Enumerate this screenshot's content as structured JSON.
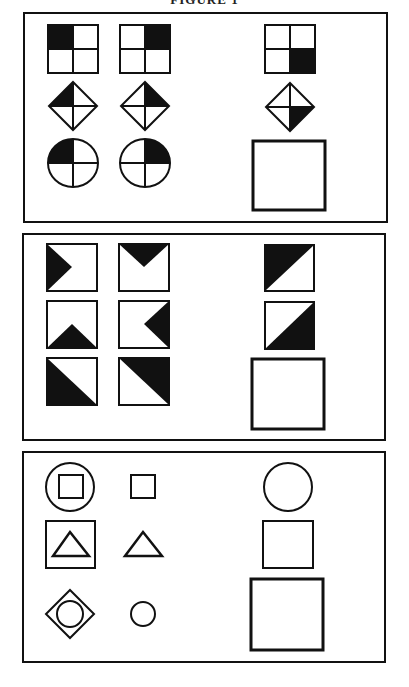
{
  "title": "FIGURE 1",
  "colors": {
    "ink": "#111111",
    "paper": "#ffffff"
  },
  "panels": [
    {
      "id": "panel-1",
      "description": "Quadrant shading rotates clockwise across each row",
      "rows": [
        {
          "shape": "square",
          "items": [
            "top-left",
            "top-right",
            "bottom-right"
          ]
        },
        {
          "shape": "diamond",
          "items": [
            "top-left",
            "top-right",
            "bottom-right"
          ]
        },
        {
          "shape": "circle",
          "items": [
            "top-left",
            "top-right",
            "answer-box"
          ]
        }
      ]
    },
    {
      "id": "panel-2",
      "description": "Black triangular regions inside squares",
      "rows": [
        {
          "items": [
            "left-wedge",
            "top-wedge",
            "upper-left-half"
          ]
        },
        {
          "items": [
            "bottom-wedge",
            "right-wedge",
            "lower-right-half"
          ]
        },
        {
          "items": [
            "lower-left-half",
            "upper-right-half",
            "answer-box"
          ]
        }
      ]
    },
    {
      "id": "panel-3",
      "description": "Outer shape removed, inner shape kept",
      "rows": [
        {
          "items": [
            "circle-with-square",
            "square",
            "circle"
          ]
        },
        {
          "items": [
            "square-with-triangle",
            "triangle",
            "square"
          ]
        },
        {
          "items": [
            "diamond-with-circle",
            "circle",
            "answer-box"
          ]
        }
      ]
    }
  ]
}
